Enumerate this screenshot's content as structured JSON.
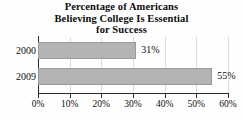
{
  "chart_data": {
    "type": "bar",
    "orientation": "horizontal",
    "title": "Percentage of Americans Believing College Is Essential for Success",
    "title_lines": [
      "Percentage of Americans",
      "Believing College Is Essential",
      "for Success"
    ],
    "categories": [
      "2000",
      "2009"
    ],
    "values": [
      31,
      55
    ],
    "value_labels": [
      "31%",
      "55%"
    ],
    "xlabel": "",
    "ylabel": "",
    "xlim": [
      0,
      60
    ],
    "xticks": [
      0,
      10,
      20,
      30,
      40,
      50,
      60
    ],
    "xtick_labels": [
      "0%",
      "10%",
      "20%",
      "30%",
      "40%",
      "50%",
      "60%"
    ],
    "grid": true,
    "grid_axis": "x",
    "legend": false,
    "bar_color": "#b4b4b4",
    "bar_edge_color": "#9a9a9a",
    "axis_color": "#2b2b2b",
    "gridline_color": "#dcdcdc",
    "background_color": "#fefefe",
    "text_color": "#0f0f0f"
  }
}
